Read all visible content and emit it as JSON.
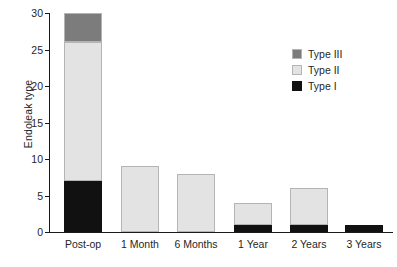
{
  "chart_data": {
    "type": "bar",
    "stacked": true,
    "title": "",
    "subtitle": "",
    "xlabel": "",
    "ylabel": "Endoleak type",
    "categories": [
      "Post-op",
      "1 Month",
      "6 Months",
      "1 Year",
      "2 Years",
      "3 Years"
    ],
    "series": [
      {
        "name": "Type I",
        "color": "#111111",
        "values": [
          7,
          0,
          0,
          1,
          1,
          1
        ]
      },
      {
        "name": "Type II",
        "color": "#e3e3e3",
        "values": [
          19,
          9,
          8,
          3,
          5,
          0
        ]
      },
      {
        "name": "Type III",
        "color": "#7c7c7c",
        "values": [
          4,
          0,
          0,
          0,
          0,
          0
        ]
      }
    ],
    "totals": [
      30,
      9,
      8,
      4,
      6,
      1
    ],
    "ylim": [
      0,
      30
    ],
    "yticks": [
      0,
      5,
      10,
      15,
      20,
      25,
      30
    ],
    "ytick_labels": [
      "0",
      "5",
      "10",
      "15",
      "20",
      "25",
      "30"
    ],
    "grid": false,
    "legend_position": "top-right",
    "legend_order": [
      "Type III",
      "Type II",
      "Type I"
    ]
  },
  "legend": {
    "items": [
      {
        "label": "Type III",
        "color": "#7c7c7c"
      },
      {
        "label": "Type II",
        "color": "#e3e3e3"
      },
      {
        "label": "Type I",
        "color": "#111111"
      }
    ]
  },
  "axes": {
    "y_title": "Endoleak type",
    "y_tick_labels": [
      "30",
      "25",
      "20",
      "15",
      "10",
      "5",
      "0"
    ],
    "x_tick_labels": [
      "Post-op",
      "1 Month",
      "6 Months",
      "1 Year",
      "2 Years",
      "3 Years"
    ]
  },
  "colors": {
    "background": "#ffffff",
    "axis": "#1a1a1a",
    "text": "#1f1f1f",
    "type_i": "#111111",
    "type_ii": "#e3e3e3",
    "type_iii": "#7c7c7c",
    "segment_outline": "#b4b4b4"
  }
}
